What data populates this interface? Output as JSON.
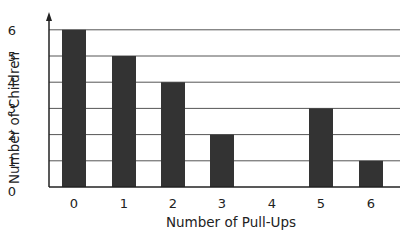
{
  "chart_data": {
    "type": "bar",
    "title": "",
    "xlabel": "Number of Pull-Ups",
    "ylabel": "Number of Children",
    "categories": [
      "0",
      "1",
      "2",
      "3",
      "4",
      "5",
      "6"
    ],
    "values": [
      6,
      5,
      4,
      2,
      0,
      3,
      1
    ],
    "y_ticks": [
      "0",
      "1",
      "2",
      "3",
      "4",
      "5",
      "6"
    ],
    "ylim": [
      0,
      6
    ],
    "grid": "horizontal",
    "legend": null,
    "bar_color": "#333333",
    "grid_color": "#555555"
  }
}
